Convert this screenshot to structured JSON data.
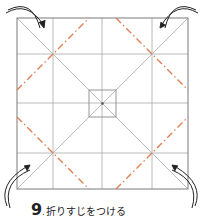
{
  "caption": {
    "step_number": "9",
    "separator": ".",
    "instruction": "折りすじをつける"
  },
  "colors": {
    "crease_gray": "#9a9a9a",
    "edge_gray": "#7a7a7a",
    "valley_fold_orange": "#e07a4f",
    "arrow": "#222222",
    "background": "#ffffff"
  },
  "diagram": {
    "paper_square": {
      "x": 17,
      "y": 18,
      "size": 171
    },
    "center_square": {
      "x": 89,
      "y": 89,
      "size": 28
    },
    "arrows": [
      "top-left-curved-arrow",
      "top-right-curved-arrow",
      "bottom-left-curved-arrow",
      "bottom-right-curved-arrow"
    ]
  }
}
